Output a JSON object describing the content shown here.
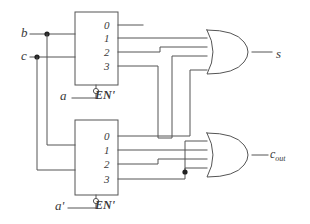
{
  "diagram": {
    "line_color": "#555555",
    "text_color": "#3a3a3a",
    "background": "#ffffff"
  },
  "inputs": [
    {
      "name": "b",
      "label": "b"
    },
    {
      "name": "c",
      "label": "c"
    },
    {
      "name": "a",
      "label": "a"
    },
    {
      "name": "a-prime",
      "label": "a'"
    }
  ],
  "outputs": [
    {
      "name": "s",
      "label": "s"
    },
    {
      "name": "c-out",
      "label": "c",
      "sub": "out"
    }
  ],
  "decoders": [
    {
      "name": "decoder-top",
      "enable_label": "EN'",
      "enable_source": "a",
      "output_labels": [
        "0",
        "1",
        "2",
        "3"
      ]
    },
    {
      "name": "decoder-bottom",
      "enable_label": "EN'",
      "enable_source": "a'",
      "output_labels": [
        "0",
        "1",
        "2",
        "3"
      ]
    }
  ],
  "gates": [
    {
      "name": "or-gate-sum",
      "type": "OR",
      "inputs": 4,
      "output": "s"
    },
    {
      "name": "or-gate-carry",
      "type": "OR",
      "inputs": 4,
      "output": "c_out"
    }
  ],
  "junctions": [
    {
      "name": "junction-b",
      "x": 47,
      "y": 34
    },
    {
      "name": "junction-c",
      "x": 37,
      "y": 57
    },
    {
      "name": "junction-carry",
      "x": 185,
      "y": 172
    }
  ]
}
